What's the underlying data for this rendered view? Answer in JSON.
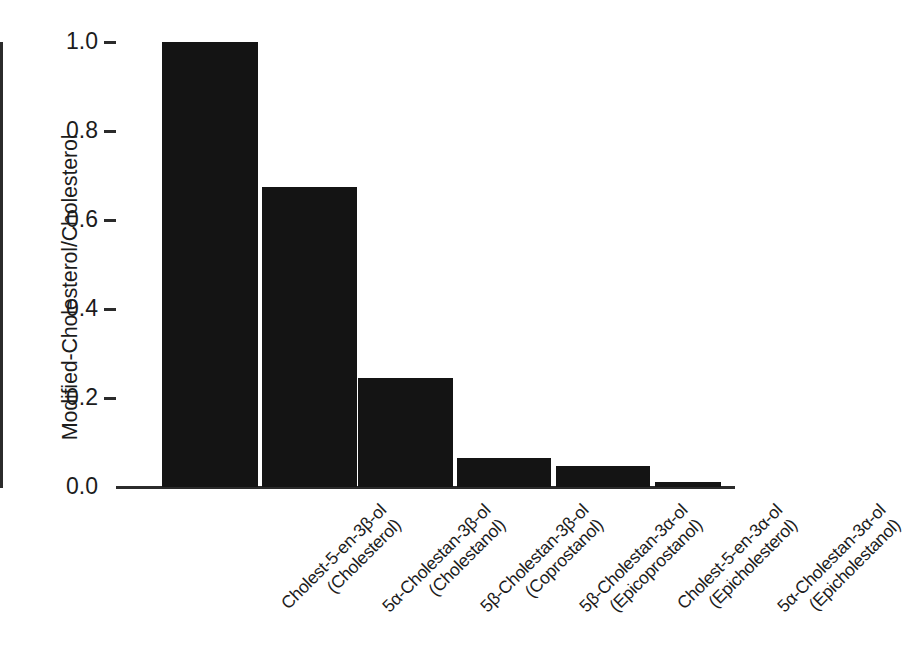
{
  "chart_data": {
    "type": "bar",
    "title": "",
    "xlabel": "",
    "ylabel": "Modified-Cholesterol/Cholesterol",
    "ylim": [
      0.0,
      1.0
    ],
    "grid": false,
    "legend": "none",
    "ytick_labels": [
      "1.0",
      "0.8",
      "0.6",
      "0.4",
      "0.2",
      "0.0"
    ],
    "ytick_values": [
      1.0,
      0.8,
      0.6,
      0.4,
      0.2,
      0.0
    ],
    "categories": [
      "Cholest-5-en-3β-ol (Cholesterol)",
      "5α-Cholestan-3β-ol (Cholestanol)",
      "5β-Cholestan-3β-ol (Coprostanol)",
      "5β-Cholestan-3α-ol (Epicoprostanol)",
      "Cholest-5-en-3α-ol (Epicholesterol)",
      "5α-Cholestan-3α-ol (Epicholestanol)"
    ],
    "category_lines": [
      {
        "line1": "Cholest-5-en-3β-ol",
        "line2": "(Cholesterol)"
      },
      {
        "line1": "5α-Cholestan-3β-ol",
        "line2": "(Cholestanol)"
      },
      {
        "line1": "5β-Cholestan-3β-ol",
        "line2": "(Coprostanol)"
      },
      {
        "line1": "5β-Cholestan-3α-ol",
        "line2": "(Epicoprostanol)"
      },
      {
        "line1": "Cholest-5-en-3α-ol",
        "line2": "(Epicholesterol)"
      },
      {
        "line1": "5α-Cholestan-3α-ol",
        "line2": "(Epicholestanol)"
      }
    ],
    "values": [
      1.0,
      0.675,
      0.245,
      0.065,
      0.047,
      0.011
    ],
    "bar_color": "#141414",
    "axis_color": "#2b2b2b",
    "background_color": "#ffffff"
  }
}
